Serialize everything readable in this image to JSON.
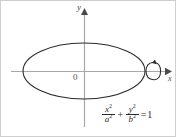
{
  "figure": {
    "title_equation_plain": "x^2/a^2 + y^2/b^2 = 1",
    "background_color": "#ffffff",
    "border_color": "#cfcfcf",
    "curve_color": "#2b2b2b",
    "axis_color": "#a8a8a8",
    "text_color": "#3a3a3a"
  },
  "axes": {
    "y_label": "y",
    "x_label": "x",
    "origin_label": "0",
    "origin_px": {
      "x": 83,
      "y": 70
    },
    "x_axis_from_px": {
      "x": 10,
      "y": 70
    },
    "x_axis_to_px": {
      "x": 168,
      "y": 70
    },
    "y_axis_from_px": {
      "x": 83,
      "y": 126
    },
    "y_axis_to_px": {
      "x": 83,
      "y": 10
    }
  },
  "ellipse": {
    "name": "ellipse-curve",
    "center_px": {
      "x": 83,
      "y": 70
    },
    "semi_axis_x_px": 61,
    "semi_axis_y_px": 28,
    "stroke_width": 1.1
  },
  "rotation_marker": {
    "name": "rotation-arrow",
    "center_px": {
      "x": 152,
      "y": 70
    },
    "rx_px": 4,
    "ry_px": 9,
    "description": "revolution-about-x-axis"
  },
  "equation": {
    "term1": {
      "numerator": "x",
      "numerator_exp": "2",
      "denominator": "a",
      "denominator_exp": "2"
    },
    "operator": "+",
    "term2": {
      "numerator": "y",
      "numerator_exp": "2",
      "denominator": "b",
      "denominator_exp": "2"
    },
    "equals": "=",
    "value": "1"
  }
}
